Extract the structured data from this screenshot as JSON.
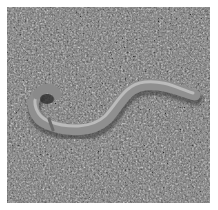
{
  "image": {
    "subject": "earthworm on soil",
    "palette": {
      "background": "#ffffff",
      "soil_dark": "#3c3c3c",
      "soil_mid": "#6e6e6e",
      "soil_light": "#bdbdbd",
      "worm_body": "#9a9a9a",
      "worm_highlight": "#c8c8c8",
      "worm_shadow": "#4a4a4a"
    }
  }
}
